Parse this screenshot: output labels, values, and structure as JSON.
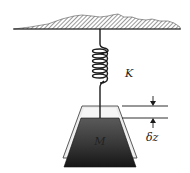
{
  "diagram": {
    "labels": {
      "spring_constant": "K",
      "mass": "M",
      "displacement": "δz"
    },
    "components": [
      {
        "name": "fixed-support",
        "description": "hatched ceiling / ground"
      },
      {
        "name": "spring",
        "label_ref": "spring_constant"
      },
      {
        "name": "mass-block",
        "label_ref": "mass",
        "note": "dark trapezoid, displaced position"
      },
      {
        "name": "mass-outline",
        "note": "light trapezoid, original position"
      },
      {
        "name": "displacement-dimension",
        "label_ref": "displacement"
      }
    ],
    "colors": {
      "line": "#1a1a1a",
      "mass_dark": "#2a2a2a",
      "mass_light": "#bdbdbd",
      "outline_fill": "#e8e8e8",
      "hatch": "#444444"
    }
  }
}
